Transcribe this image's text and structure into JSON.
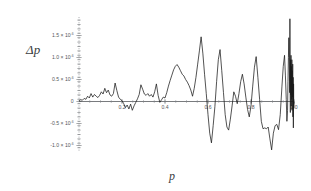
{
  "chart_data": {
    "type": "line",
    "title": "",
    "subtitle": "",
    "xlabel": "p",
    "ylabel": "Δp",
    "xlim": [
      0.0,
      1.0
    ],
    "ylim": [
      -1.25,
      1.95
    ],
    "grid": false,
    "legend": null,
    "y_scale_factor": "×10⁻⁶",
    "x_ticks": [
      0.2,
      0.4,
      0.6,
      0.8,
      1.0
    ],
    "x_tick_labels": [
      "0.2",
      "0.4",
      "0.6",
      "0.8",
      "1.0"
    ],
    "y_ticks": [
      -1.0,
      -0.5,
      0,
      0.5,
      1.0,
      1.5
    ],
    "y_tick_labels": [
      {
        "mantissa": "-1.0 × 10",
        "exponent": "-6"
      },
      {
        "mantissa": "-0.5 × 10",
        "exponent": "-6"
      },
      {
        "mantissa": "0",
        "exponent": ""
      },
      {
        "mantissa": "0.5 × 10",
        "exponent": "-6"
      },
      {
        "mantissa": "1.0 × 10",
        "exponent": "-6"
      },
      {
        "mantissa": "1.5 × 10",
        "exponent": "-6"
      }
    ],
    "series": [
      {
        "name": "Δp",
        "color": "#1a1a1a",
        "x": [
          0.0,
          0.008,
          0.016,
          0.024,
          0.032,
          0.04,
          0.048,
          0.056,
          0.064,
          0.072,
          0.08,
          0.088,
          0.096,
          0.104,
          0.112,
          0.12,
          0.128,
          0.136,
          0.144,
          0.152,
          0.16,
          0.168,
          0.176,
          0.184,
          0.192,
          0.2,
          0.208,
          0.216,
          0.224,
          0.232,
          0.24,
          0.248,
          0.256,
          0.264,
          0.272,
          0.28,
          0.288,
          0.296,
          0.304,
          0.312,
          0.32,
          0.328,
          0.336,
          0.344,
          0.352,
          0.36,
          0.368,
          0.376,
          0.384,
          0.392,
          0.4,
          0.408,
          0.416,
          0.424,
          0.432,
          0.44,
          0.448,
          0.456,
          0.464,
          0.472,
          0.48,
          0.488,
          0.496,
          0.504,
          0.512,
          0.52,
          0.528,
          0.536,
          0.544,
          0.552,
          0.56,
          0.568,
          0.576,
          0.584,
          0.592,
          0.6,
          0.608,
          0.616,
          0.624,
          0.632,
          0.64,
          0.648,
          0.656,
          0.664,
          0.672,
          0.68,
          0.688,
          0.696,
          0.704,
          0.712,
          0.72,
          0.728,
          0.736,
          0.744,
          0.752,
          0.76,
          0.768,
          0.776,
          0.784,
          0.792,
          0.8,
          0.808,
          0.816,
          0.824,
          0.832,
          0.84,
          0.848,
          0.856,
          0.864,
          0.872,
          0.88,
          0.888,
          0.896,
          0.904,
          0.912,
          0.92,
          0.928,
          0.936,
          0.944,
          0.95,
          0.956,
          0.96,
          0.964,
          0.967,
          0.97,
          0.972,
          0.974,
          0.976,
          0.978,
          0.98,
          0.981,
          0.982,
          0.983,
          0.984,
          0.985,
          0.986,
          0.987,
          0.988,
          0.989,
          0.99,
          0.991,
          0.992,
          0.993,
          0.994,
          0.995,
          0.996,
          0.997,
          0.998,
          0.999,
          1.0
        ],
        "y": [
          0.02,
          0.04,
          0.03,
          0.07,
          0.05,
          0.12,
          0.08,
          0.18,
          0.1,
          0.16,
          0.12,
          0.09,
          0.14,
          0.22,
          0.17,
          0.3,
          0.2,
          0.26,
          0.15,
          0.12,
          0.18,
          0.42,
          0.25,
          0.1,
          0.05,
          0.02,
          -0.05,
          -0.14,
          -0.08,
          -0.17,
          -0.06,
          -0.2,
          -0.1,
          -0.02,
          0.06,
          0.16,
          0.38,
          0.28,
          0.17,
          0.14,
          0.18,
          0.12,
          0.16,
          0.1,
          0.22,
          0.4,
          0.14,
          -0.02,
          0.04,
          0.1,
          0.08,
          0.2,
          0.35,
          0.48,
          0.6,
          0.72,
          0.8,
          0.84,
          0.78,
          0.7,
          0.62,
          0.58,
          0.5,
          0.44,
          0.36,
          0.26,
          0.12,
          0.3,
          0.55,
          0.85,
          1.15,
          1.47,
          1.1,
          0.62,
          0.18,
          -0.3,
          -0.72,
          -0.94,
          -0.55,
          -0.12,
          0.45,
          0.95,
          1.18,
          0.7,
          0.2,
          -0.3,
          -0.58,
          -0.65,
          -0.4,
          -0.1,
          0.22,
          0.12,
          -0.05,
          0.18,
          0.45,
          0.62,
          0.4,
          0.1,
          -0.18,
          -0.35,
          -0.1,
          0.35,
          0.78,
          1.02,
          0.55,
          0.05,
          -0.45,
          -0.62,
          -0.6,
          -0.62,
          -0.58,
          -0.85,
          -1.1,
          -0.72,
          -0.55,
          -0.52,
          -0.64,
          -0.3,
          0.35,
          0.8,
          1.05,
          0.6,
          0.05,
          -0.45,
          -0.2,
          0.45,
          1.0,
          1.45,
          0.9,
          0.2,
          1.88,
          0.6,
          -0.25,
          0.95,
          0.15,
          1.05,
          -0.1,
          0.8,
          0.05,
          0.95,
          -0.2,
          0.7,
          0.1,
          0.85,
          -0.35,
          0.55,
          -0.6,
          0.4,
          -0.15,
          0.0
        ]
      }
    ]
  },
  "axes": {
    "y_label": "Δp",
    "x_label": "p"
  },
  "colors": {
    "line": "#1a1a1a",
    "axis": "#3f4246",
    "yaxis_dotted": "#9a9da1",
    "tick_text": "#55585c",
    "background": "#ffffff"
  }
}
